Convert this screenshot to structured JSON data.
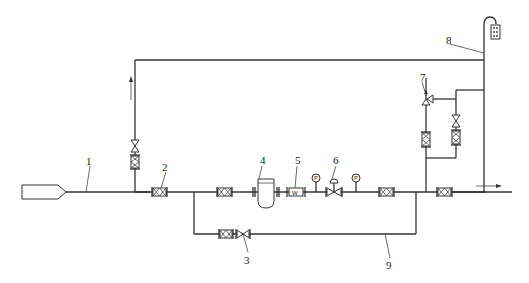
{
  "diagram": {
    "type": "piping-flow-schematic",
    "labels": {
      "l1": "1",
      "l2": "2",
      "l3": "3",
      "l4": "4",
      "l5": "5",
      "l6": "6",
      "l7": "7",
      "l8": "8",
      "l9": "9"
    },
    "gauge_symbol": "P",
    "filter_symbol": "W",
    "components": [
      {
        "id": "1",
        "name": "source-tank / inlet pipe"
      },
      {
        "id": "2",
        "name": "inlet isolation valve"
      },
      {
        "id": "3",
        "name": "bypass valve"
      },
      {
        "id": "4",
        "name": "separator / strainer vessel"
      },
      {
        "id": "5",
        "name": "filter"
      },
      {
        "id": "6",
        "name": "pressure regulating valve"
      },
      {
        "id": "7",
        "name": "safety relief valve"
      },
      {
        "id": "8",
        "name": "vent pipe with flame arrester"
      },
      {
        "id": "9",
        "name": "bypass line"
      }
    ],
    "flow_directions": [
      "up (vertical return line)",
      "right (outlet)"
    ]
  }
}
